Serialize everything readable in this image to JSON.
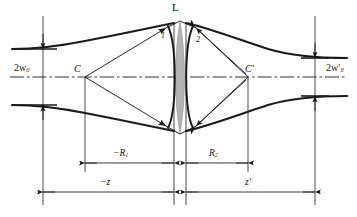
{
  "figure": {
    "type": "optical-ray-diagram",
    "width": 357,
    "height": 217,
    "background": "#ffffff",
    "stroke_color": "#1a1a1a",
    "lens_fill": "#b3b3b3",
    "lens_stroke": "#8a8a8a"
  },
  "labels": {
    "lens": "L",
    "wavefront_1": "1",
    "wavefront_2": "2",
    "center_left": "C",
    "center_right": "C′",
    "waist_left_main": "2w",
    "waist_left_sub": "0",
    "waist_right_main": "2w",
    "waist_right_prime": "′",
    "waist_right_sub": "0",
    "radius_1_main": "−R",
    "radius_1_sub": "1",
    "radius_2_main": "R",
    "radius_2_sub": "2",
    "distance_z": "−z",
    "distance_z_prime": "z′"
  },
  "label_text": {
    "waist_left": "2w0",
    "waist_right": "2w′0",
    "radius_1": "−R1",
    "radius_2": "R2",
    "distance_object": "−z",
    "distance_image": "z′"
  },
  "geometry": {
    "axis_y": 77,
    "lens_x": 180,
    "lens_top_y": 22,
    "lens_bottom_y": 133,
    "lens_half_width": 5,
    "waist_left_x": 43,
    "waist_left_half": 28,
    "waist_right_x": 315,
    "waist_right_half": 23,
    "center_left_x": 85,
    "center_right_x": 248,
    "ray_top_y_at_lens": 26,
    "ray_bottom_y_at_lens": 128,
    "dim_R_y": 163,
    "dim_z_y": 192,
    "gap_left_x": 174,
    "gap_right_x": 186
  }
}
